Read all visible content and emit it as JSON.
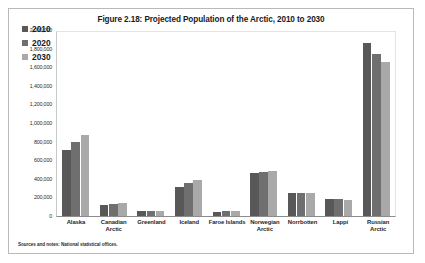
{
  "figure": {
    "title": "Figure 2.18: Projected Population of the Arctic, 2010 to 2030",
    "source_note": "Sources and notes: National statistical offices."
  },
  "colors": {
    "series_2010": "#585858",
    "series_2020": "#6f6f6f",
    "series_2030": "#a9a9a9",
    "frame": "#b9b9b9",
    "axis": "#8c8c8c"
  },
  "chart_data": {
    "type": "bar",
    "title": "Figure 2.18: Projected Population of the Arctic, 2010 to 2030",
    "xlabel": "",
    "ylabel": "",
    "ylim": [
      0,
      2000000
    ],
    "grid": false,
    "legend_position": "top-left",
    "y_ticks": [
      "2,000,000",
      "1,800,000",
      "1,600,000",
      "1,400,000",
      "1,200,000",
      "1,000,000",
      "800,000",
      "600,000",
      "400,000",
      "200,000",
      "0"
    ],
    "y_tick_values": [
      2000000,
      1800000,
      1600000,
      1400000,
      1200000,
      1000000,
      800000,
      600000,
      400000,
      200000,
      0
    ],
    "categories": [
      "Alaska",
      "Canadian Arctic",
      "Greenland",
      "Iceland",
      "Faroe Islands",
      "Norwegian Arctic",
      "Norrbotten",
      "Lappi",
      "Russian Arctic"
    ],
    "series": [
      {
        "name": "2010",
        "values": [
          710000,
          115000,
          57000,
          318000,
          48000,
          463000,
          249000,
          183000,
          1870000
        ]
      },
      {
        "name": "2020",
        "values": [
          800000,
          128000,
          57000,
          352000,
          49000,
          478000,
          248000,
          182000,
          1750000
        ]
      },
      {
        "name": "2030",
        "values": [
          880000,
          140000,
          58000,
          390000,
          50000,
          492000,
          246000,
          178000,
          1660000
        ]
      }
    ]
  }
}
